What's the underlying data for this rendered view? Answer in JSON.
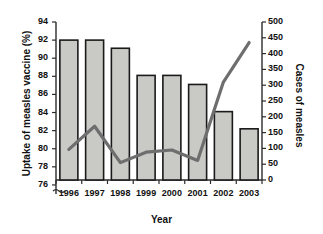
{
  "chart_data": {
    "type": "bar",
    "title": "",
    "subtitle": "",
    "xlabel": "Year",
    "ylabel": "Uptake of measles vaccine (%)",
    "y2label": "Cases of measles",
    "categories": [
      "1996",
      "1997",
      "1998",
      "1999",
      "2000",
      "2001",
      "2002",
      "2003"
    ],
    "grid": false,
    "legend": "none",
    "ylim": [
      75,
      94
    ],
    "y_ticks": [
      "76",
      "78",
      "80",
      "82",
      "84",
      "86",
      "88",
      "90",
      "92",
      "94"
    ],
    "y_tick_values": [
      76,
      78,
      80,
      82,
      84,
      86,
      88,
      90,
      92,
      94
    ],
    "y_axis_break": true,
    "y2lim": [
      0,
      500
    ],
    "y2_ticks": [
      "0",
      "50",
      "100",
      "150",
      "200",
      "250",
      "300",
      "350",
      "400",
      "450",
      "500"
    ],
    "y2_tick_values": [
      0,
      50,
      100,
      150,
      200,
      250,
      300,
      350,
      400,
      450,
      500
    ],
    "series": [
      {
        "name": "Uptake of measles vaccine (%)",
        "type": "bar",
        "axis": "left",
        "values": [
          92.0,
          92.0,
          91.1,
          88.1,
          88.1,
          87.1,
          84.1,
          82.2
        ],
        "color": "#c9cac6",
        "edge_color": "#1a1a1a"
      },
      {
        "name": "Cases of measles",
        "type": "line",
        "axis": "right",
        "values": [
          97,
          170,
          55,
          88,
          95,
          62,
          310,
          435
        ],
        "color": "#6e6e6e"
      }
    ]
  }
}
